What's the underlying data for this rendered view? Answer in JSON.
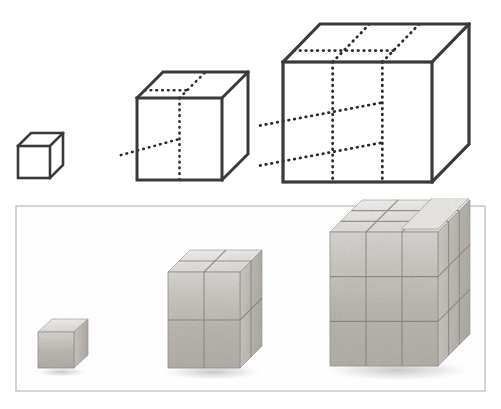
{
  "figure": {
    "description": "Line drawings of three cubes of edge length 1, 2 and 3 units above a photograph of the same three cube stacks built from physical wooden blocks.",
    "background_color": "#ffffff",
    "ink_color": "#3a3a3a",
    "dotted_color": "#2b2b2b"
  },
  "diagram": {
    "name": "line-drawing-panel",
    "cubes": [
      {
        "id": "cube-1",
        "label": "1 x 1 x 1 cube",
        "edge_units": 1,
        "unit_count": 1,
        "geometry": {
          "front_x": 18,
          "front_y": 146,
          "front_w": 32,
          "front_h": 32,
          "depth_x": 13,
          "depth_y": 13
        },
        "divisions": 1,
        "stroke_width": 2.6
      },
      {
        "id": "cube-2",
        "label": "2 x 2 x 2 cube",
        "edge_units": 2,
        "unit_count": 8,
        "geometry": {
          "front_x": 137,
          "front_y": 98,
          "front_w": 85,
          "front_h": 82,
          "depth_x": 26,
          "depth_y": 26
        },
        "divisions": 2,
        "stroke_width": 3.0
      },
      {
        "id": "cube-3",
        "label": "3 x 3 x 3 cube",
        "edge_units": 3,
        "unit_count": 27,
        "geometry": {
          "front_x": 283,
          "front_y": 62,
          "front_w": 149,
          "front_h": 120,
          "depth_x": 37,
          "depth_y": 38
        },
        "divisions": 3,
        "stroke_width": 3.2
      }
    ]
  },
  "photo": {
    "name": "photograph-panel",
    "border_color": "#b9b9b9",
    "backdrop_color": "#fdfdfd",
    "frame": {
      "x": 16,
      "y": 8,
      "w": 469,
      "h": 185
    },
    "stacks": [
      {
        "id": "photo-stack-1",
        "label": "single block",
        "edge_units": 1,
        "block_count": 1,
        "geometry": {
          "front_x": 38,
          "front_y": 332,
          "front_w": 36,
          "front_h": 36,
          "depth_x": 14,
          "depth_y": 13
        }
      },
      {
        "id": "photo-stack-2",
        "label": "two by two by two block stack",
        "edge_units": 2,
        "block_count": 8,
        "geometry": {
          "front_x": 168,
          "front_y": 272,
          "front_w": 72,
          "front_h": 96,
          "depth_x": 22,
          "depth_y": 22
        }
      },
      {
        "id": "photo-stack-3",
        "label": "three by three by three block stack",
        "edge_units": 3,
        "block_count": 27,
        "geometry": {
          "front_x": 330,
          "front_y": 232,
          "front_w": 108,
          "front_h": 134,
          "depth_x": 32,
          "depth_y": 32
        }
      }
    ]
  }
}
